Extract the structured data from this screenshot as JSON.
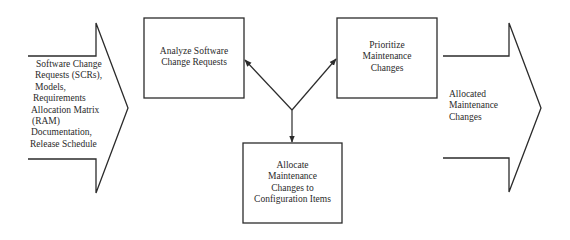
{
  "diagram": {
    "type": "process-flow",
    "input": {
      "lines": [
        "Software Change",
        "Requests (SCRs),",
        "Models,",
        "Requirements",
        "Allocation Matrix",
        "(RAM)",
        "Documentation,",
        "Release Schedule"
      ]
    },
    "output": {
      "lines": [
        "Allocated",
        "Maintenance",
        "Changes"
      ]
    },
    "nodes": [
      {
        "id": "analyze",
        "lines": [
          "Analyze Software",
          "Change Requests"
        ]
      },
      {
        "id": "prioritize",
        "lines": [
          "Prioritize",
          "Maintenance",
          "Changes"
        ]
      },
      {
        "id": "allocate",
        "lines": [
          "Allocate",
          "Maintenance",
          "Changes to",
          "Configuration Items"
        ]
      }
    ],
    "edges": [
      {
        "from": "junction",
        "to": "analyze"
      },
      {
        "from": "junction",
        "to": "prioritize"
      },
      {
        "from": "junction",
        "to": "allocate"
      }
    ],
    "colors": {
      "stroke": "#2b2b2b",
      "background": "#ffffff",
      "text": "#2a2a2a"
    }
  }
}
